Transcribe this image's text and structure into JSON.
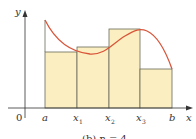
{
  "figure": {
    "type": "riemann-sum-diagram",
    "axes": {
      "x_label": "x",
      "y_label": "y",
      "origin_label": "0"
    },
    "tick_labels": [
      {
        "main": "a",
        "sub": ""
      },
      {
        "main": "x",
        "sub": "1"
      },
      {
        "main": "x",
        "sub": "2"
      },
      {
        "main": "x",
        "sub": "3"
      },
      {
        "main": "b",
        "sub": ""
      }
    ],
    "caption": "(b) n = 4",
    "colors": {
      "rect_fill": "#fbeec0",
      "rect_stroke": "#555555",
      "curve": "#d9553a",
      "axis": "#333333"
    },
    "rectangles": [
      {
        "x0": 45,
        "x1": 77,
        "top": 52
      },
      {
        "x0": 77,
        "x1": 109,
        "top": 47
      },
      {
        "x0": 109,
        "x1": 140,
        "top": 29
      },
      {
        "x0": 140,
        "x1": 172,
        "top": 69
      }
    ]
  }
}
